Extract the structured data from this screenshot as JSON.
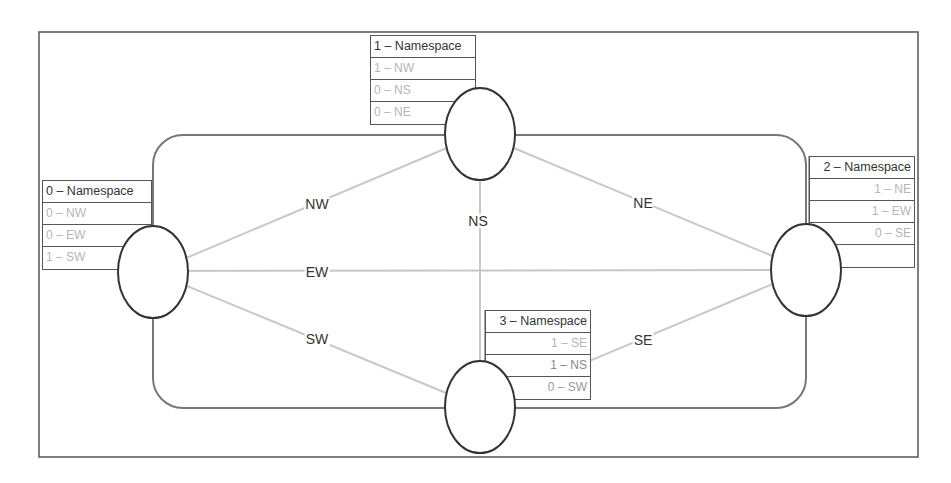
{
  "diagram": {
    "colors": {
      "frame": "#555555",
      "ring": "#777777",
      "edge": "#c8c8c8",
      "node_stroke": "#333333",
      "entry_text": "#b5b5b5",
      "header_text": "#333333"
    },
    "edges": [
      {
        "id": "NW",
        "label": "NW"
      },
      {
        "id": "NS",
        "label": "NS"
      },
      {
        "id": "NE",
        "label": "NE"
      },
      {
        "id": "EW",
        "label": "EW"
      },
      {
        "id": "SW",
        "label": "SW"
      },
      {
        "id": "SE",
        "label": "SE"
      }
    ],
    "namespaces": [
      {
        "header": "0 – Namespace",
        "rows": [
          "0 – NW",
          "0 – EW",
          "1 – SW"
        ]
      },
      {
        "header": "1 – Namespace",
        "rows": [
          "1 – NW",
          "0 – NS",
          "0 – NE"
        ]
      },
      {
        "header": "2 – Namespace",
        "rows": [
          "1 – NE",
          "1 – EW",
          "0 – SE",
          ""
        ]
      },
      {
        "header": "3 – Namespace",
        "rows": [
          "1 – SE",
          "1 – NS",
          "0 – SW"
        ]
      }
    ]
  }
}
